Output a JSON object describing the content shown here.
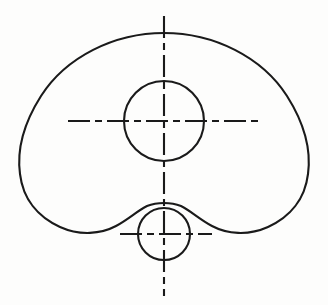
{
  "drawing": {
    "title": "Cam Plate Outline Technical Drawing",
    "view_label": "front-view",
    "canvas": {
      "width": 328,
      "height": 305,
      "background_color": "#fdfdfc"
    },
    "style": {
      "object_line_color": "#1a1a1a",
      "object_line_width": 2.1,
      "center_line_color": "#1a1a1a",
      "center_line_width": 2.1,
      "center_line_dash": "22 5 7 5"
    },
    "features": [
      {
        "name": "outer-contour",
        "type": "closed-profile",
        "description": "Kidney / cam shaped closed outline, symmetric about the vertical axis, with concave S-curve reliefs at the lower left and lower right blending tangentially into the small lower circle.",
        "extents": {
          "top": 33,
          "bottom": 246,
          "left": 21,
          "right": 308
        },
        "path": "M 164 33 C 214 33 262 57 287 96 C 306 126 311 152 308 174 C 305 199 290 217 268 227 C 248 236 227 234 212 226 C 199 219 191 211 181 206 C 176 204 170 203 164 203 C 158 203 152 204 147 206 C 137 211 129 219 116 226 C 101 234 80 236 60 227 C 38 217 23 199 20 174 C 17 152 22 126 41 96 C 66 57 114 33 164 33 Z"
      },
      {
        "name": "upper-circle",
        "type": "circle",
        "center_x": 164,
        "center_y": 121,
        "radius": 40
      },
      {
        "name": "lower-circle",
        "type": "circle",
        "center_x": 164,
        "center_y": 234,
        "radius": 26
      },
      {
        "name": "vertical-centerline",
        "type": "center-line",
        "orientation": "vertical",
        "x": 164,
        "y_start": 16,
        "y_end": 296
      },
      {
        "name": "upper-horizontal-centerline",
        "type": "center-line",
        "orientation": "horizontal",
        "y": 121,
        "x_start": 68,
        "x_end": 262
      },
      {
        "name": "lower-horizontal-centerline",
        "type": "center-line",
        "orientation": "horizontal",
        "y": 234,
        "x_start": 120,
        "x_end": 212
      }
    ]
  }
}
